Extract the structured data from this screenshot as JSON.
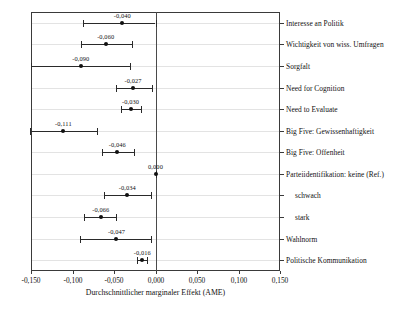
{
  "chart_data": {
    "type": "scatter",
    "title": "",
    "xlabel": "Durchschnittlicher marginaler Effekt (AME)",
    "ylabel": "",
    "xlim": [
      -0.15,
      0.15
    ],
    "xticks": [
      -0.15,
      -0.1,
      -0.05,
      0.0,
      0.05,
      0.1,
      0.15
    ],
    "xticklabels": [
      "-0,150",
      "-0,100",
      "-0,050",
      "0,000",
      "0,050",
      "0,100",
      "0,150"
    ],
    "grid": true,
    "legend": "none",
    "reference_line": 0.0,
    "categories": [
      "Interesse an Politik",
      "Wichtigkeit von wiss. Umfragen",
      "Sorgfalt",
      "Need for Cognition",
      "Need to Evaluate",
      "Big Five: Gewissenhaftigkeit",
      "Big Five: Offenheit",
      "Parteiidentifikation: keine (Ref.)",
      "schwach",
      "stark",
      "Wahlnorm",
      "Politische Kommunikation"
    ],
    "points": [
      {
        "label": "Interesse an Politik",
        "value": -0.04,
        "value_label": "-0,040",
        "ci_low": -0.087,
        "ci_high": 0.0,
        "indent": false
      },
      {
        "label": "Wichtigkeit von wiss. Umfragen",
        "value": -0.06,
        "value_label": "-0,060",
        "ci_low": -0.09,
        "ci_high": -0.028,
        "indent": false
      },
      {
        "label": "Sorgfalt",
        "value": -0.09,
        "value_label": "-0,090",
        "ci_low": -0.15,
        "ci_high": -0.031,
        "indent": false
      },
      {
        "label": "Need for Cognition",
        "value": -0.027,
        "value_label": "-0,027",
        "ci_low": -0.048,
        "ci_high": -0.004,
        "indent": false
      },
      {
        "label": "Need to Evaluate",
        "value": -0.03,
        "value_label": "-0,030",
        "ci_low": -0.041,
        "ci_high": -0.018,
        "indent": false
      },
      {
        "label": "Big Five: Gewissenhaftigkeit",
        "value": -0.111,
        "value_label": "-0,111",
        "ci_low": -0.151,
        "ci_high": -0.071,
        "indent": false
      },
      {
        "label": "Big Five: Offenheit",
        "value": -0.046,
        "value_label": "-0,046",
        "ci_low": -0.065,
        "ci_high": -0.026,
        "indent": false
      },
      {
        "label": "Parteiidentifikation: keine (Ref.)",
        "value": 0.0,
        "value_label": "0,000",
        "ci_low": 0.0,
        "ci_high": 0.0,
        "indent": false
      },
      {
        "label": "schwach",
        "value": -0.034,
        "value_label": "-0,034",
        "ci_low": -0.062,
        "ci_high": -0.006,
        "indent": true
      },
      {
        "label": "stark",
        "value": -0.066,
        "value_label": "-0,066",
        "ci_low": -0.086,
        "ci_high": -0.047,
        "indent": true
      },
      {
        "label": "Wahlnorm",
        "value": -0.047,
        "value_label": "-0,047",
        "ci_low": -0.091,
        "ci_high": -0.005,
        "indent": false
      },
      {
        "label": "Politische Kommunikation",
        "value": -0.016,
        "value_label": "-0,016",
        "ci_low": -0.022,
        "ci_high": -0.01,
        "indent": false
      }
    ]
  },
  "colors": {
    "point": "#111111",
    "error_bar": "#2a2a2a",
    "grid": "#e3e3e3",
    "frame": "#3a3a3a",
    "zero_line": "#4a4a4a",
    "background": "#ffffff"
  }
}
